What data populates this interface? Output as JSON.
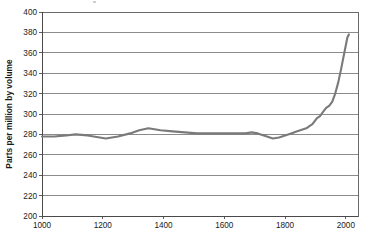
{
  "chart_data": {
    "type": "line",
    "title": "",
    "xlabel": "",
    "ylabel": "Parts per million by volume",
    "xlim": [
      1000,
      2040
    ],
    "ylim": [
      200,
      400
    ],
    "xticks": [
      1000,
      1200,
      1400,
      1600,
      1800,
      2000
    ],
    "yticks": [
      200,
      220,
      240,
      260,
      280,
      300,
      320,
      340,
      360,
      380,
      400
    ],
    "grid": true,
    "legend": "none",
    "series": [
      {
        "name": "Atmospheric concentration",
        "color": "#7a7a7a",
        "x": [
          1000,
          1040,
          1080,
          1110,
          1150,
          1190,
          1210,
          1250,
          1290,
          1320,
          1350,
          1390,
          1430,
          1470,
          1510,
          1550,
          1590,
          1630,
          1670,
          1690,
          1710,
          1730,
          1750,
          1760,
          1780,
          1800,
          1820,
          1840,
          1850,
          1860,
          1870,
          1880,
          1890,
          1900,
          1905,
          1915,
          1925,
          1935,
          1945,
          1955,
          1965,
          1975,
          1985,
          1995,
          2005,
          2010
        ],
        "y": [
          278,
          278,
          279,
          280,
          279,
          277,
          276,
          278,
          281,
          284,
          286,
          284,
          283,
          282,
          281,
          281,
          281,
          281,
          281,
          282,
          281,
          279,
          277,
          276,
          277,
          279,
          281,
          283,
          284,
          285,
          286,
          288,
          290,
          294,
          296,
          298,
          302,
          306,
          308,
          312,
          320,
          331,
          345,
          360,
          375,
          378
        ]
      }
    ]
  },
  "axis": {
    "ytick_labels": [
      "400",
      "380",
      "360",
      "340",
      "320",
      "300",
      "280",
      "260",
      "240",
      "220",
      "200"
    ],
    "xtick_labels": [
      "1000",
      "1200",
      "1400",
      "1600",
      "1800",
      "2000"
    ],
    "y_axis_title": "Parts per million by volume"
  }
}
